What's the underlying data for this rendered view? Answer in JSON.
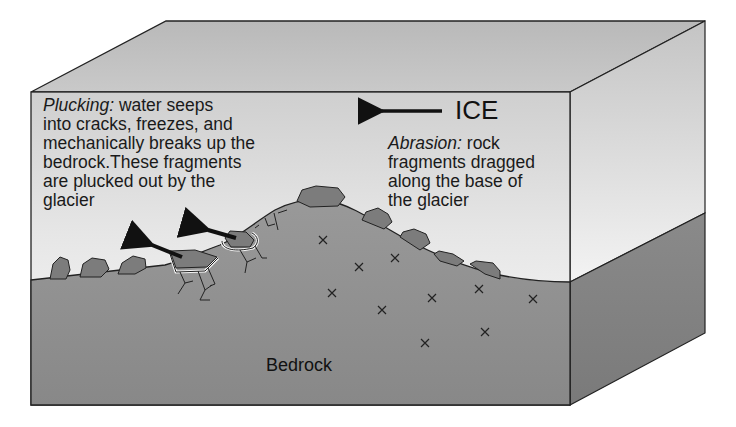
{
  "diagram": {
    "labels": {
      "ice": "ICE",
      "bedrock": "Bedrock",
      "plucking_term": "Plucking:",
      "plucking_text": " water seeps\ninto cracks, freezes, and\nmechanically breaks up the\nbedrock.These fragments\nare plucked out by the\nglacier",
      "abrasion_term": "Abrasion:",
      "abrasion_text": " rock\nfragments dragged\nalong the base of\nthe glacier"
    },
    "arrows": {
      "ice_flow_direction": "left",
      "plucked_fragment_direction": "up-left"
    },
    "colors": {
      "ice_top": "#bdbdbd",
      "ice_front_light": "#f4f4f4",
      "ice_front_dark": "#c8c8c8",
      "bedrock": "#8e8e8e",
      "bedrock_side": "#7e7e7e",
      "rock": "#7a7a7a",
      "outline": "#222222"
    },
    "markers": {
      "x_marks_count": 11,
      "x_mark_symbol": "×"
    }
  }
}
